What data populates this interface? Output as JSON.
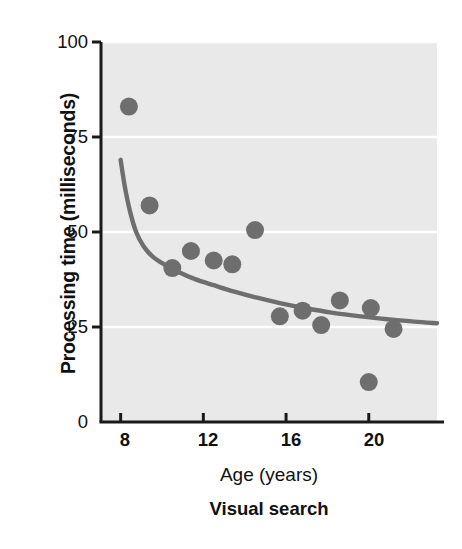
{
  "chart_data": {
    "type": "scatter",
    "title": "",
    "subtitle": "Visual search",
    "xlabel": "Age (years)",
    "ylabel": "Processing time (milliseconds)",
    "xlim": [
      7.05,
      23.3
    ],
    "ylim": [
      0,
      100
    ],
    "xticks": [
      8,
      12,
      16,
      20
    ],
    "xtick_labels": [
      "8",
      "12",
      "16",
      "20"
    ],
    "yticks": [
      0,
      25,
      50,
      75,
      100
    ],
    "ytick_labels": [
      "0",
      "25",
      "50",
      "75",
      "100"
    ],
    "grid": "horizontal-white",
    "legend": "none",
    "plot_background": "#e9e9e9",
    "marker_color": "#6e6e6e",
    "line_color": "#6e6e6e",
    "gridline_color": "#ffffff",
    "axis_color": "#1a1a1a",
    "marker_radius_px": 9,
    "series": [
      {
        "name": "Visual search",
        "kind": "points",
        "points": [
          {
            "x": 8.4,
            "y": 83.0
          },
          {
            "x": 9.4,
            "y": 57.0
          },
          {
            "x": 10.5,
            "y": 40.5
          },
          {
            "x": 11.4,
            "y": 45.0
          },
          {
            "x": 12.5,
            "y": 42.5
          },
          {
            "x": 13.4,
            "y": 41.5
          },
          {
            "x": 14.5,
            "y": 50.5
          },
          {
            "x": 15.7,
            "y": 27.8
          },
          {
            "x": 16.8,
            "y": 29.3
          },
          {
            "x": 17.7,
            "y": 25.5
          },
          {
            "x": 18.6,
            "y": 32.0
          },
          {
            "x": 20.1,
            "y": 30.0
          },
          {
            "x": 20.0,
            "y": 10.5
          },
          {
            "x": 21.2,
            "y": 24.5
          }
        ]
      },
      {
        "name": "Fitted decay curve",
        "kind": "line",
        "points": [
          {
            "x": 8.0,
            "y": 69.0
          },
          {
            "x": 8.2,
            "y": 62.0
          },
          {
            "x": 8.45,
            "y": 55.5
          },
          {
            "x": 8.75,
            "y": 50.0
          },
          {
            "x": 9.1,
            "y": 46.3
          },
          {
            "x": 9.55,
            "y": 43.5
          },
          {
            "x": 10.1,
            "y": 41.5
          },
          {
            "x": 10.8,
            "y": 39.5
          },
          {
            "x": 11.6,
            "y": 37.6
          },
          {
            "x": 12.5,
            "y": 36.0
          },
          {
            "x": 13.5,
            "y": 34.3
          },
          {
            "x": 14.6,
            "y": 32.7
          },
          {
            "x": 15.7,
            "y": 31.3
          },
          {
            "x": 16.9,
            "y": 30.0
          },
          {
            "x": 18.2,
            "y": 28.8
          },
          {
            "x": 19.6,
            "y": 27.8
          },
          {
            "x": 21.0,
            "y": 27.0
          },
          {
            "x": 22.2,
            "y": 26.4
          },
          {
            "x": 23.3,
            "y": 26.0
          }
        ]
      }
    ]
  }
}
